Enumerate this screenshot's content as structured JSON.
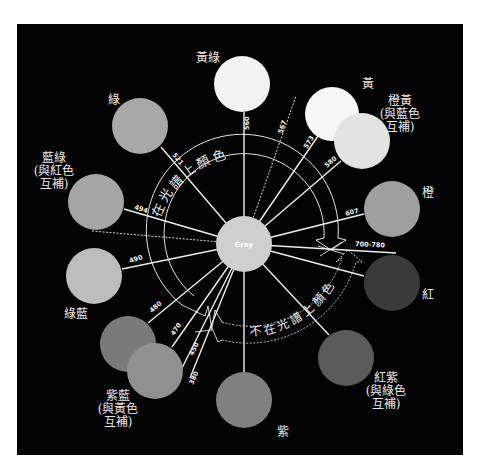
{
  "diagram": {
    "background": "#030303",
    "center": {
      "label": "Gray",
      "cx": 244,
      "cy": 244,
      "r": 28,
      "fill": "#cfcfcf"
    },
    "arc_labels": {
      "in_spectrum": "在光譜上顏色",
      "not_in_spectrum": "不在光譜上顏色"
    },
    "colors": [
      {
        "id": "yellow-green",
        "label": [
          "黃綠"
        ],
        "cx": 242,
        "cy": 84,
        "r": 28,
        "fill": "#f2f2f2",
        "label_x": 208,
        "label_y": 62,
        "align": "middle"
      },
      {
        "id": "yellow",
        "label": [
          "黃"
        ],
        "cx": 332,
        "cy": 114,
        "r": 27,
        "fill": "#f7f7f7",
        "label_x": 368,
        "label_y": 88,
        "align": "middle"
      },
      {
        "id": "orange-yellow",
        "label": [
          "橙黃",
          "(與藍色",
          "互補)"
        ],
        "cx": 362,
        "cy": 141,
        "r": 28,
        "fill": "#e3e3e3",
        "label_x": 400,
        "label_y": 105,
        "align": "middle"
      },
      {
        "id": "green",
        "label": [
          "綠"
        ],
        "cx": 140,
        "cy": 126,
        "r": 28,
        "fill": "#a8a8a8",
        "label_x": 114,
        "label_y": 104,
        "align": "middle"
      },
      {
        "id": "blue-green",
        "label": [
          "藍綠",
          "(與紅色",
          "互補)"
        ],
        "cx": 96,
        "cy": 202,
        "r": 28,
        "fill": "#a5a5a5",
        "label_x": 54,
        "label_y": 162,
        "align": "middle"
      },
      {
        "id": "orange",
        "label": [
          "橙"
        ],
        "cx": 392,
        "cy": 209,
        "r": 28,
        "fill": "#9f9f9f",
        "label_x": 428,
        "label_y": 197,
        "align": "middle"
      },
      {
        "id": "cyan-blue",
        "label": [
          "綠藍"
        ],
        "cx": 94,
        "cy": 276,
        "r": 28,
        "fill": "#bdbdbd",
        "label_x": 76,
        "label_y": 318,
        "align": "middle"
      },
      {
        "id": "red",
        "label": [
          "紅"
        ],
        "cx": 392,
        "cy": 283,
        "r": 28,
        "fill": "#3a3a3a",
        "label_x": 428,
        "label_y": 299,
        "align": "middle"
      },
      {
        "id": "purple-blue-1",
        "label": [],
        "cx": 128,
        "cy": 344,
        "r": 28,
        "fill": "#7a7a7a",
        "label_x": 0,
        "label_y": 0,
        "align": "middle"
      },
      {
        "id": "purple-blue-2",
        "label": [
          "紫藍",
          "(與黃色",
          "互補)"
        ],
        "cx": 155,
        "cy": 371,
        "r": 28,
        "fill": "#909090",
        "label_x": 118,
        "label_y": 400,
        "align": "middle"
      },
      {
        "id": "red-purple",
        "label": [
          "紅紫",
          "(與綠色",
          "互補)"
        ],
        "cx": 346,
        "cy": 358,
        "r": 28,
        "fill": "#5b5b5b",
        "label_x": 386,
        "label_y": 382,
        "align": "middle"
      },
      {
        "id": "purple",
        "label": [
          "紫"
        ],
        "cx": 244,
        "cy": 400,
        "r": 28,
        "fill": "#808080",
        "label_x": 283,
        "label_y": 436,
        "align": "middle"
      }
    ],
    "spokes": [
      {
        "nm": "560",
        "x2": 244,
        "y2": 112,
        "dashed": false,
        "lx": 249,
        "ly": 130,
        "rot": -90
      },
      {
        "nm": "567",
        "x2": 296,
        "y2": 96,
        "dashed": true,
        "lx": 282,
        "ly": 134,
        "rot": -70
      },
      {
        "nm": "573",
        "x2": 318,
        "y2": 136,
        "dashed": false,
        "lx": 307,
        "ly": 149,
        "rot": -58
      },
      {
        "nm": "580",
        "x2": 341,
        "y2": 161,
        "dashed": false,
        "lx": 327,
        "ly": 168,
        "rot": -42
      },
      {
        "nm": "521",
        "x2": 161,
        "y2": 147,
        "dashed": false,
        "lx": 172,
        "ly": 155,
        "rot": 52
      },
      {
        "nm": "494",
        "x2": 124,
        "y2": 209,
        "dashed": false,
        "lx": 134,
        "ly": 209,
        "rot": 17
      },
      {
        "nm": "",
        "x2": 92,
        "y2": 231,
        "dashed": true,
        "lx": 0,
        "ly": 0,
        "rot": 0
      },
      {
        "nm": "607",
        "x2": 364,
        "y2": 214,
        "dashed": false,
        "lx": 346,
        "ly": 216,
        "rot": -15
      },
      {
        "nm": "700-780",
        "x2": 396,
        "y2": 253,
        "dashed": false,
        "lx": 355,
        "ly": 246,
        "rot": 3
      },
      {
        "nm": "490",
        "x2": 122,
        "y2": 269,
        "dashed": false,
        "lx": 130,
        "ly": 263,
        "rot": -17
      },
      {
        "nm": "",
        "x2": 364,
        "y2": 276,
        "dashed": false,
        "lx": 0,
        "ly": 0,
        "rot": 0
      },
      {
        "nm": "480",
        "x2": 148,
        "y2": 323,
        "dashed": false,
        "lx": 152,
        "ly": 313,
        "rot": -42
      },
      {
        "nm": "470",
        "x2": 172,
        "y2": 347,
        "dashed": false,
        "lx": 174,
        "ly": 336,
        "rot": -56
      },
      {
        "nm": "450",
        "x2": 182,
        "y2": 368,
        "dashed": false,
        "lx": 193,
        "ly": 356,
        "rot": -64
      },
      {
        "nm": "380",
        "x2": 190,
        "y2": 378,
        "dashed": false,
        "lx": 193,
        "ly": 385,
        "rot": -66
      },
      {
        "nm": "",
        "x2": 244,
        "y2": 372,
        "dashed": false,
        "lx": 0,
        "ly": 0,
        "rot": 0
      },
      {
        "nm": "",
        "x2": 329,
        "y2": 335,
        "dashed": false,
        "lx": 0,
        "ly": 0,
        "rot": 0
      }
    ]
  }
}
